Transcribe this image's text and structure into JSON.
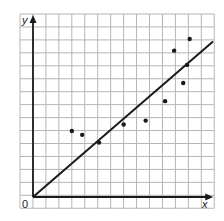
{
  "chart_data": {
    "type": "scatter",
    "title": "",
    "xlabel": "x",
    "ylabel": "y",
    "origin_label": "0",
    "xlim": [
      -1,
      14
    ],
    "ylim": [
      -1,
      14
    ],
    "grid": true,
    "tick_labels": false,
    "points": [
      {
        "x": 3.0,
        "y": 5.1
      },
      {
        "x": 3.8,
        "y": 4.8
      },
      {
        "x": 5.1,
        "y": 4.2
      },
      {
        "x": 7.0,
        "y": 5.6
      },
      {
        "x": 8.7,
        "y": 5.9
      },
      {
        "x": 10.2,
        "y": 7.4
      },
      {
        "x": 11.6,
        "y": 8.8
      },
      {
        "x": 11.9,
        "y": 10.2
      },
      {
        "x": 10.9,
        "y": 11.3
      },
      {
        "x": 12.1,
        "y": 12.2
      }
    ],
    "trend_line": {
      "x1": 0,
      "y1": 0,
      "x2": 13.9,
      "y2": 12.0
    },
    "colors": {
      "grid": "#b5b5b5",
      "axis": "#1a1a1a",
      "points": "#1a1a1a",
      "line": "#1a1a1a"
    }
  }
}
